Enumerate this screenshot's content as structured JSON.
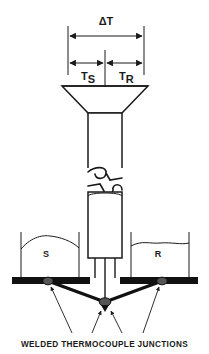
{
  "figure": {
    "caption": "WELDED THERMOCOUPLE JUNCTIONS",
    "background_color": "#ffffff",
    "line_color": "#1a1a1a",
    "fill_color": "#ffffff",
    "plate_color": "#111111",
    "junction_color": "#555555"
  },
  "dimensions": {
    "total": {
      "label": "ΔT",
      "label_plain": "delta-T",
      "style": "double-headed-arrow",
      "x_start": 68,
      "x_end": 144,
      "y": 36
    },
    "sample_side": {
      "label_main": "T",
      "label_sub": "S",
      "label_plain": "Ts",
      "style": "double-headed-arrow",
      "x_start": 68,
      "x_end": 105,
      "y": 63
    },
    "reference_side": {
      "label_main": "T",
      "label_sub": "R",
      "label_plain": "Tr",
      "style": "double-headed-arrow",
      "x_start": 105,
      "x_end": 144,
      "y": 63
    }
  },
  "pans": [
    {
      "id": "sample-pan",
      "label": "S",
      "meaning": "sample",
      "side": "left",
      "surface_shape": "domed"
    },
    {
      "id": "reference-pan",
      "label": "R",
      "meaning": "reference",
      "side": "right",
      "surface_shape": "flat-wavy"
    }
  ],
  "junctions": [
    {
      "id": "junction-left",
      "label": "welded thermocouple junction",
      "position": "left-plate"
    },
    {
      "id": "junction-center",
      "label": "welded thermocouple junction",
      "position": "center-below-stem"
    },
    {
      "id": "junction-right",
      "label": "welded thermocouple junction",
      "position": "right-plate"
    }
  ],
  "components": {
    "funnel": "tapered-hopper",
    "upper_tube": "vertical-tube",
    "break_symbol": "broken-line-break",
    "lower_tube": "vertical-tube",
    "stem_wires": 3,
    "platform": "thermocouple-plate"
  }
}
